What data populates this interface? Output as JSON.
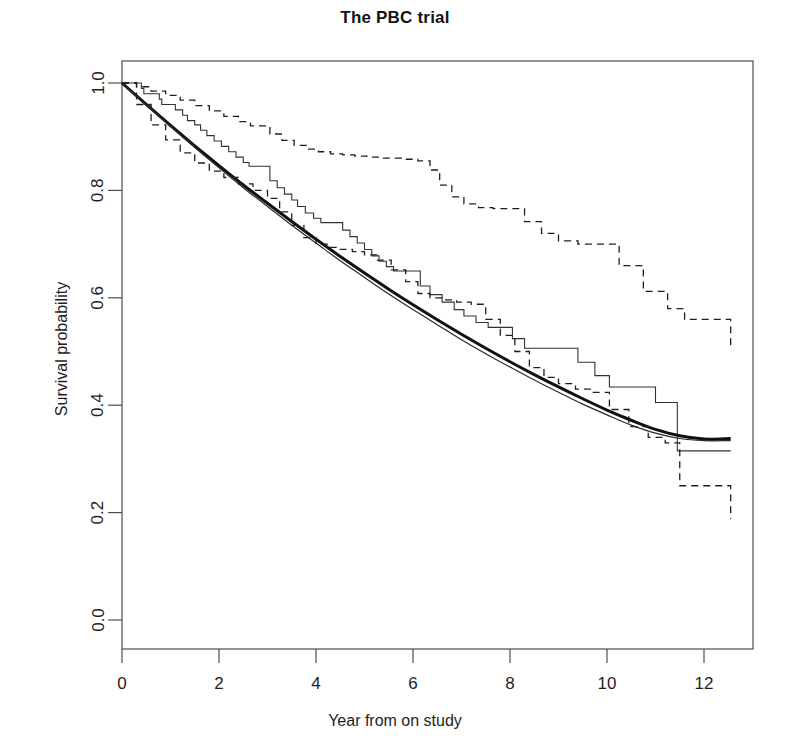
{
  "chart_data": {
    "type": "line",
    "title": "The PBC trial",
    "xlabel": "Year from on study",
    "ylabel": "Survival probability",
    "xlim": [
      -0.15,
      13.0
    ],
    "ylim": [
      -0.02,
      1.04
    ],
    "xticks": [
      0,
      2,
      4,
      6,
      8,
      10,
      12
    ],
    "xtick_labels": [
      "0",
      "2",
      "4",
      "6",
      "8",
      "10",
      "12"
    ],
    "yticks": [
      0.0,
      0.2,
      0.4,
      0.6,
      0.8,
      1.0
    ],
    "ytick_labels": [
      "0.0",
      "0.2",
      "0.4",
      "0.6",
      "0.8",
      "1.0"
    ],
    "grid": false,
    "legend": "none",
    "box": true,
    "series": [
      {
        "name": "Kaplan-Meier estimate",
        "style": "step",
        "linestyle": "solid",
        "linewidth": 1.1,
        "color": "#333333",
        "x": [
          0.0,
          0.4,
          0.45,
          0.77,
          0.82,
          1.1,
          1.25,
          1.35,
          1.5,
          1.62,
          1.75,
          1.9,
          2.05,
          2.2,
          2.35,
          2.5,
          2.62,
          2.8,
          3.05,
          3.2,
          3.35,
          3.5,
          3.62,
          3.78,
          3.95,
          4.1,
          4.25,
          4.4,
          4.55,
          4.7,
          4.85,
          5.0,
          5.15,
          5.3,
          5.45,
          5.6,
          5.78,
          5.95,
          6.15,
          6.35,
          6.6,
          6.85,
          7.05,
          7.3,
          7.55,
          7.8,
          8.05,
          8.3,
          8.6,
          8.85,
          9.1,
          9.4,
          9.75,
          10.05,
          10.45,
          11.0,
          11.45,
          12.55
        ],
        "y": [
          1.0,
          0.99,
          0.98,
          0.97,
          0.96,
          0.95,
          0.94,
          0.93,
          0.922,
          0.912,
          0.902,
          0.892,
          0.882,
          0.872,
          0.862,
          0.852,
          0.845,
          0.845,
          0.818,
          0.805,
          0.793,
          0.782,
          0.77,
          0.758,
          0.748,
          0.74,
          0.74,
          0.74,
          0.726,
          0.714,
          0.702,
          0.69,
          0.678,
          0.668,
          0.658,
          0.65,
          0.65,
          0.65,
          0.622,
          0.606,
          0.592,
          0.578,
          0.566,
          0.554,
          0.545,
          0.545,
          0.524,
          0.506,
          0.506,
          0.506,
          0.506,
          0.48,
          0.455,
          0.434,
          0.434,
          0.405,
          0.315,
          0.315
        ]
      },
      {
        "name": "Fitted model (thick)",
        "style": "smooth",
        "linestyle": "solid",
        "linewidth": 3.0,
        "color": "#111111",
        "x": [
          0.0,
          0.5,
          1.0,
          1.5,
          2.0,
          2.5,
          3.0,
          3.5,
          4.0,
          4.5,
          5.0,
          5.5,
          6.0,
          6.5,
          7.0,
          7.5,
          8.0,
          8.5,
          9.0,
          9.5,
          10.0,
          10.5,
          11.0,
          11.5,
          12.0,
          12.55
        ],
        "y": [
          1.0,
          0.96,
          0.921,
          0.883,
          0.846,
          0.81,
          0.776,
          0.742,
          0.709,
          0.677,
          0.646,
          0.616,
          0.587,
          0.559,
          0.532,
          0.506,
          0.481,
          0.457,
          0.434,
          0.412,
          0.391,
          0.372,
          0.355,
          0.343,
          0.337,
          0.338
        ]
      },
      {
        "name": "Fitted model (thin)",
        "style": "smooth",
        "linestyle": "solid",
        "linewidth": 1.2,
        "color": "#2a2a2a",
        "x": [
          0.0,
          0.5,
          1.0,
          1.5,
          2.0,
          2.5,
          3.0,
          3.5,
          4.0,
          4.5,
          5.0,
          5.5,
          6.0,
          6.5,
          7.0,
          7.5,
          8.0,
          8.5,
          9.0,
          9.5,
          10.0,
          10.5,
          11.0,
          11.5,
          12.0,
          12.55
        ],
        "y": [
          1.0,
          0.959,
          0.919,
          0.88,
          0.842,
          0.805,
          0.77,
          0.735,
          0.702,
          0.669,
          0.638,
          0.607,
          0.578,
          0.55,
          0.522,
          0.496,
          0.471,
          0.447,
          0.424,
          0.402,
          0.382,
          0.363,
          0.348,
          0.338,
          0.334,
          0.334
        ]
      },
      {
        "name": "Upper 95% confidence band",
        "style": "step",
        "linestyle": "dashed",
        "linewidth": 1.3,
        "color": "#1f1f1f",
        "x": [
          0.0,
          0.3,
          0.6,
          0.9,
          1.2,
          1.5,
          1.8,
          2.1,
          2.4,
          2.65,
          2.85,
          3.05,
          3.3,
          3.55,
          3.8,
          4.05,
          4.3,
          4.55,
          4.8,
          5.05,
          5.35,
          5.6,
          5.85,
          6.1,
          6.35,
          6.55,
          6.8,
          7.05,
          7.35,
          7.65,
          7.95,
          8.3,
          8.65,
          9.0,
          9.4,
          9.8,
          10.25,
          10.75,
          11.25,
          11.6,
          12.55
        ],
        "y": [
          1.0,
          0.993,
          0.985,
          0.977,
          0.968,
          0.958,
          0.948,
          0.938,
          0.928,
          0.92,
          0.92,
          0.905,
          0.893,
          0.884,
          0.877,
          0.872,
          0.868,
          0.866,
          0.864,
          0.862,
          0.86,
          0.86,
          0.858,
          0.855,
          0.838,
          0.81,
          0.788,
          0.775,
          0.768,
          0.766,
          0.766,
          0.742,
          0.72,
          0.706,
          0.7,
          0.7,
          0.66,
          0.612,
          0.58,
          0.56,
          0.507
        ]
      },
      {
        "name": "Lower 95% confidence band",
        "style": "step",
        "linestyle": "dashed",
        "linewidth": 1.3,
        "color": "#1f1f1f",
        "x": [
          0.0,
          0.3,
          0.6,
          0.9,
          1.2,
          1.5,
          1.8,
          2.1,
          2.4,
          2.7,
          3.0,
          3.25,
          3.5,
          3.75,
          4.0,
          4.25,
          4.5,
          4.75,
          5.0,
          5.25,
          5.55,
          5.85,
          6.1,
          6.35,
          6.6,
          6.9,
          7.2,
          7.5,
          7.8,
          8.1,
          8.4,
          8.7,
          9.0,
          9.35,
          9.7,
          10.05,
          10.45,
          10.85,
          11.2,
          11.5,
          12.55
        ],
        "y": [
          1.0,
          0.96,
          0.922,
          0.894,
          0.87,
          0.851,
          0.836,
          0.824,
          0.812,
          0.8,
          0.785,
          0.76,
          0.735,
          0.712,
          0.7,
          0.694,
          0.69,
          0.686,
          0.68,
          0.67,
          0.652,
          0.63,
          0.608,
          0.6,
          0.596,
          0.592,
          0.588,
          0.56,
          0.53,
          0.5,
          0.47,
          0.452,
          0.44,
          0.43,
          0.424,
          0.392,
          0.36,
          0.34,
          0.33,
          0.25,
          0.188
        ]
      }
    ]
  }
}
